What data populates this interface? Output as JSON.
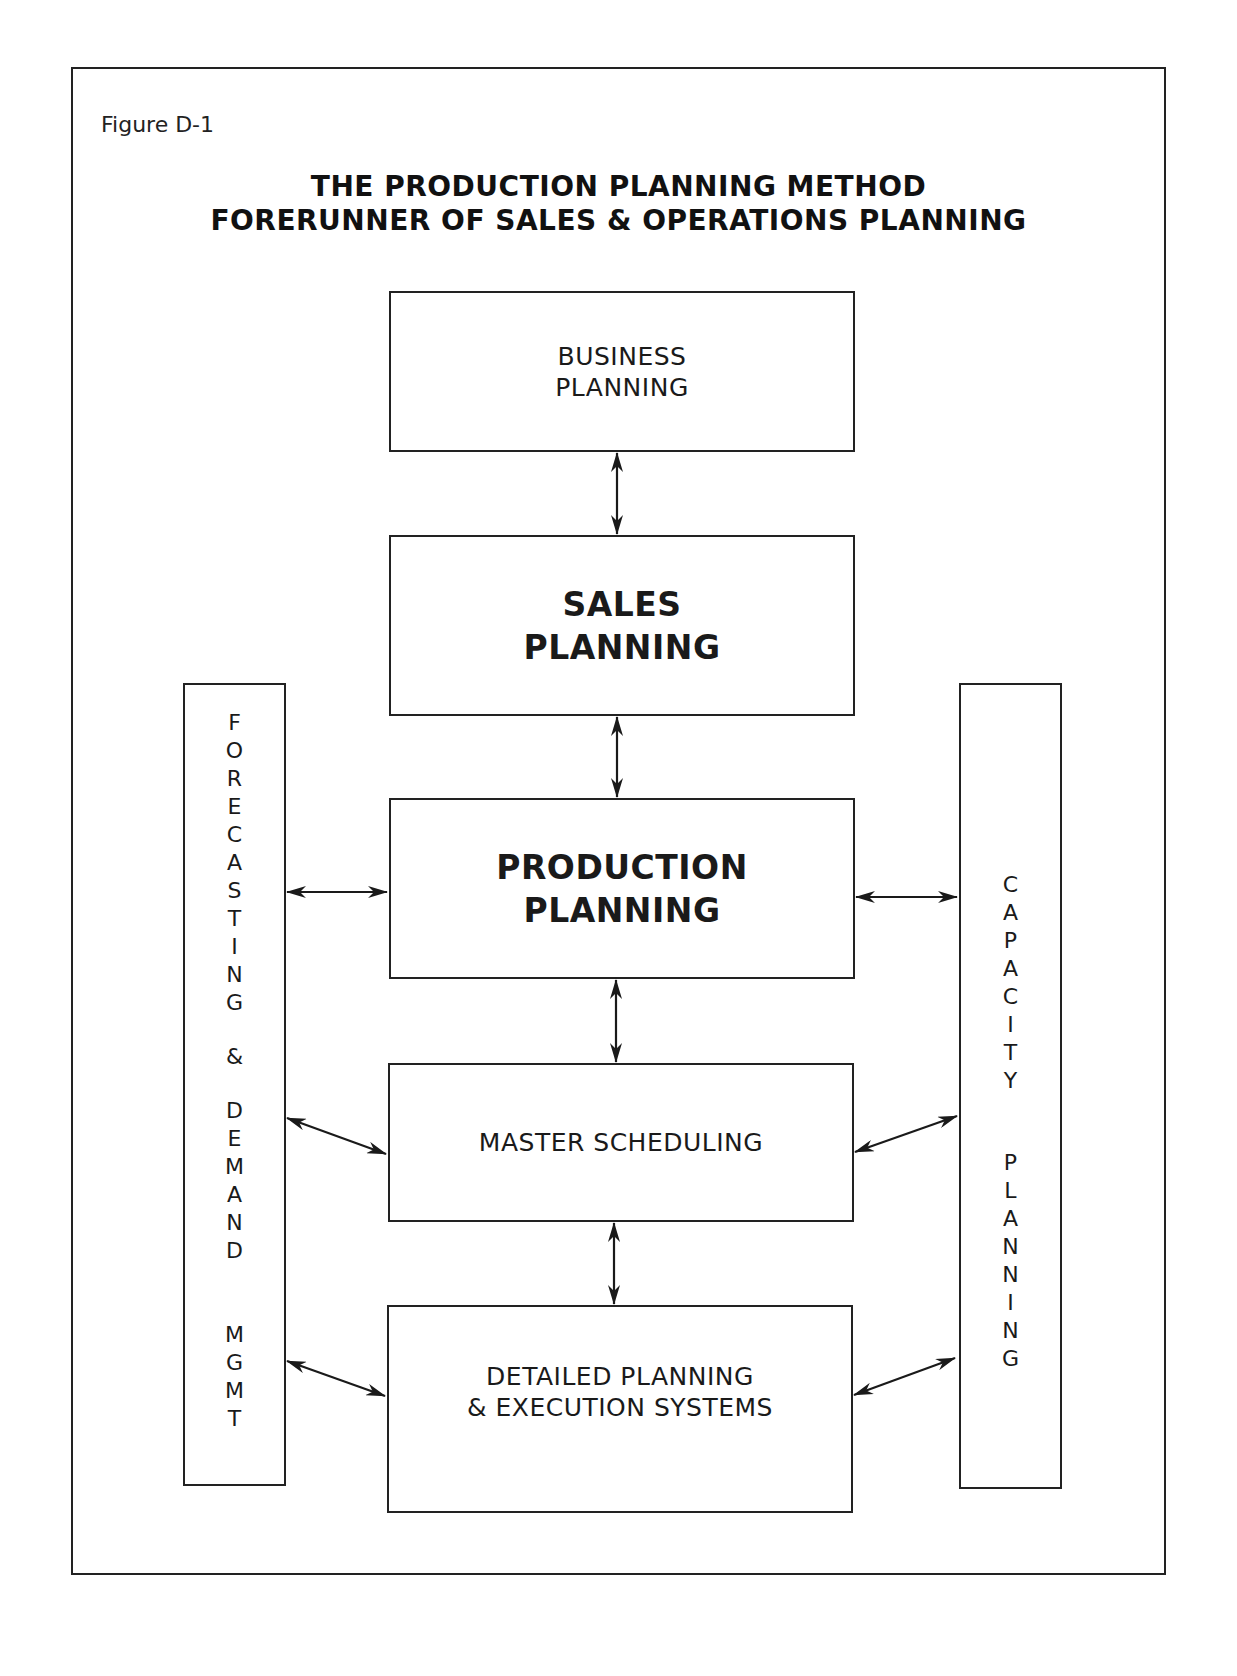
{
  "figure_label": "Figure D-1",
  "title": {
    "line1": "THE PRODUCTION PLANNING METHOD",
    "line2": "FORERUNNER OF SALES & OPERATIONS PLANNING"
  },
  "boxes": [
    {
      "id": "business-planning",
      "label": "BUSINESS\nPLANNING",
      "bold": false
    },
    {
      "id": "sales-planning",
      "label": "SALES\nPLANNING",
      "bold": true
    },
    {
      "id": "production-planning",
      "label": "PRODUCTION\nPLANNING",
      "bold": true
    },
    {
      "id": "master-scheduling",
      "label": "MASTER SCHEDULING",
      "bold": false
    },
    {
      "id": "detailed-planning",
      "label": "DETAILED PLANNING\n& EXECUTION SYSTEMS",
      "bold": false
    }
  ],
  "side_bars": {
    "left": {
      "label": "FORECASTING & DEMAND MGMT",
      "letters": [
        "F",
        "O",
        "R",
        "E",
        "C",
        "A",
        "S",
        "T",
        "I",
        "N",
        "G",
        "&",
        "D",
        "E",
        "M",
        "A",
        "N",
        "D",
        "M",
        "G",
        "M",
        "T"
      ]
    },
    "right": {
      "label": "CAPACITY PLANNING",
      "letters": [
        "C",
        "A",
        "P",
        "A",
        "C",
        "I",
        "T",
        "Y",
        "P",
        "L",
        "A",
        "N",
        "N",
        "I",
        "N",
        "G"
      ]
    }
  },
  "connections": [
    {
      "from": "business-planning",
      "to": "sales-planning",
      "type": "bidirectional"
    },
    {
      "from": "sales-planning",
      "to": "production-planning",
      "type": "bidirectional"
    },
    {
      "from": "production-planning",
      "to": "master-scheduling",
      "type": "bidirectional"
    },
    {
      "from": "master-scheduling",
      "to": "detailed-planning",
      "type": "bidirectional"
    },
    {
      "from": "forecasting-demand-mgmt",
      "to": "production-planning",
      "type": "bidirectional"
    },
    {
      "from": "forecasting-demand-mgmt",
      "to": "master-scheduling",
      "type": "bidirectional"
    },
    {
      "from": "forecasting-demand-mgmt",
      "to": "detailed-planning",
      "type": "bidirectional"
    },
    {
      "from": "production-planning",
      "to": "capacity-planning",
      "type": "bidirectional"
    },
    {
      "from": "master-scheduling",
      "to": "capacity-planning",
      "type": "bidirectional"
    },
    {
      "from": "detailed-planning",
      "to": "capacity-planning",
      "type": "bidirectional"
    }
  ]
}
